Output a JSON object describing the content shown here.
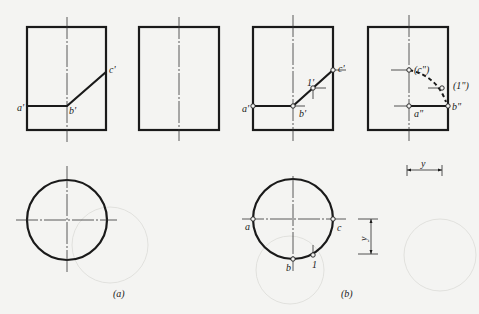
{
  "figure": {
    "captions": {
      "a": "(a)",
      "b": "(b)"
    },
    "colors": {
      "line": "#1a1a1a",
      "background": "#f4f4f2"
    },
    "panel_a": {
      "front_view_labels": {
        "a": "a'",
        "b": "b'",
        "c": "c'"
      },
      "side_view_labels": {},
      "top_view_labels": {}
    },
    "panel_b": {
      "front_view_labels": {
        "a": "a'",
        "b": "b'",
        "c": "c'",
        "p1": "1'"
      },
      "side_view_labels": {
        "c": "(c\")",
        "p1": "(1\")",
        "a": "a\"",
        "b": "b\""
      },
      "top_view_labels": {
        "a": "a",
        "b": "b",
        "c": "c",
        "p1": "1"
      },
      "dimension_labels": {
        "horizontal": "y",
        "vertical": "y"
      }
    }
  }
}
